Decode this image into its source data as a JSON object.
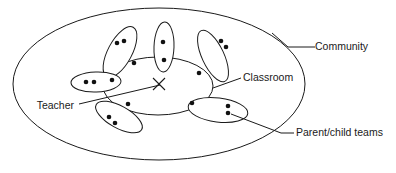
{
  "diagram": {
    "colors": {
      "stroke": "#1a1a1a",
      "dot_fill": "#111111",
      "background": "#ffffff"
    },
    "labels": {
      "community": "Community",
      "classroom": "Classroom",
      "teacher": "Teacher",
      "parent_child_teams": "Parent/child teams"
    },
    "marker": {
      "teacher_symbol": "X"
    },
    "regions": [
      {
        "id": "community",
        "name": "Community",
        "shape": "ellipse",
        "cx": 159,
        "cy": 84,
        "rx": 146,
        "ry": 76
      },
      {
        "id": "classroom",
        "name": "Classroom",
        "shape": "ellipse",
        "cx": 158,
        "cy": 86,
        "rx": 55,
        "ry": 29
      }
    ],
    "teams": [
      {
        "id": "team-upper-left",
        "name": "Parent/child team",
        "cx": 120,
        "cy": 52,
        "rx": 12,
        "ry": 28,
        "rotation": 28,
        "member_count": 3
      },
      {
        "id": "team-top-center",
        "name": "Parent/child team",
        "cx": 164,
        "cy": 47,
        "rx": 10,
        "ry": 25,
        "rotation": 2,
        "member_count": 2
      },
      {
        "id": "team-upper-right",
        "name": "Parent/child team",
        "cx": 213,
        "cy": 56,
        "rx": 11,
        "ry": 28,
        "rotation": -25,
        "member_count": 3
      },
      {
        "id": "team-left",
        "name": "Parent/child team",
        "cx": 96,
        "cy": 82,
        "rx": 25,
        "ry": 10,
        "rotation": -2,
        "member_count": 3
      },
      {
        "id": "team-lower-left",
        "name": "Parent/child team",
        "cx": 119,
        "cy": 117,
        "rx": 26,
        "ry": 11,
        "rotation": 29,
        "member_count": 3
      },
      {
        "id": "team-lower-right",
        "name": "Parent/child team",
        "cx": 218,
        "cy": 110,
        "rx": 30,
        "ry": 12,
        "rotation": 7,
        "member_count": 3
      }
    ],
    "members": [
      {
        "cx": 117,
        "cy": 43,
        "r": 2.3
      },
      {
        "cx": 124,
        "cy": 41,
        "r": 2.3
      },
      {
        "cx": 134,
        "cy": 63,
        "r": 2.3
      },
      {
        "cx": 163,
        "cy": 42,
        "r": 2.3
      },
      {
        "cx": 164,
        "cy": 60,
        "r": 2.3
      },
      {
        "cx": 221,
        "cy": 41,
        "r": 2.3
      },
      {
        "cx": 226,
        "cy": 47,
        "r": 2.3
      },
      {
        "cx": 199,
        "cy": 73,
        "r": 2.3
      },
      {
        "cx": 86,
        "cy": 82,
        "r": 2.3
      },
      {
        "cx": 94,
        "cy": 82,
        "r": 2.3
      },
      {
        "cx": 112,
        "cy": 80,
        "r": 2.3
      },
      {
        "cx": 128,
        "cy": 104,
        "r": 2.3
      },
      {
        "cx": 109,
        "cy": 117,
        "r": 2.3
      },
      {
        "cx": 115,
        "cy": 123,
        "r": 2.3
      },
      {
        "cx": 192,
        "cy": 103,
        "r": 2.3
      },
      {
        "cx": 228,
        "cy": 106,
        "r": 2.3
      },
      {
        "cx": 228,
        "cy": 113,
        "r": 2.3
      }
    ],
    "callouts": [
      {
        "id": "community-callout",
        "label": "Community",
        "text_x": 315,
        "text_y": 47,
        "anchor": "start",
        "line": "M 315 47 L 288 47 L 272 33"
      },
      {
        "id": "classroom-callout",
        "label": "Classroom",
        "text_x": 243,
        "text_y": 78,
        "anchor": "start",
        "line": "M 241 78 L 213 88"
      },
      {
        "id": "teacher-callout",
        "label": "Teacher",
        "text_x": 74,
        "text_y": 106,
        "anchor": "end",
        "line": "M 79 104 L 160 85"
      },
      {
        "id": "parent-child-callout",
        "label": "Parent/child teams",
        "text_x": 296,
        "text_y": 133,
        "anchor": "start",
        "line": "M 294 133 L 281 133 L 231 114"
      }
    ]
  }
}
